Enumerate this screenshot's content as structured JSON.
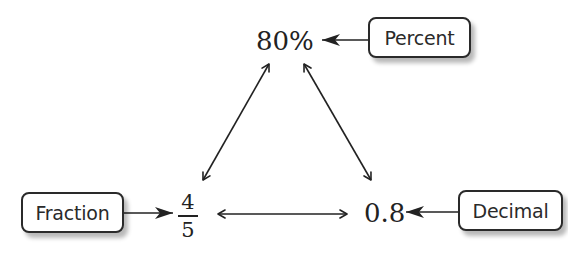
{
  "diagram": {
    "title": "",
    "nodes": {
      "percent_value": "80%",
      "fraction_numerator": "4",
      "fraction_denominator": "5",
      "decimal_value": "0.8"
    },
    "labels": {
      "percent": "Percent",
      "fraction": "Fraction",
      "decimal": "Decimal"
    },
    "edges": [
      {
        "from": "Percent label",
        "to": "80%",
        "type": "single-arrow"
      },
      {
        "from": "Fraction label",
        "to": "4/5",
        "type": "single-arrow"
      },
      {
        "from": "Decimal label",
        "to": "0.8",
        "type": "single-arrow"
      },
      {
        "from": "80%",
        "to": "4/5",
        "type": "double-arrow"
      },
      {
        "from": "80%",
        "to": "0.8",
        "type": "double-arrow"
      },
      {
        "from": "4/5",
        "to": "0.8",
        "type": "double-arrow"
      }
    ],
    "colors": {
      "line": "#222222",
      "box_border": "#2a2a2a",
      "background": "#ffffff"
    }
  }
}
